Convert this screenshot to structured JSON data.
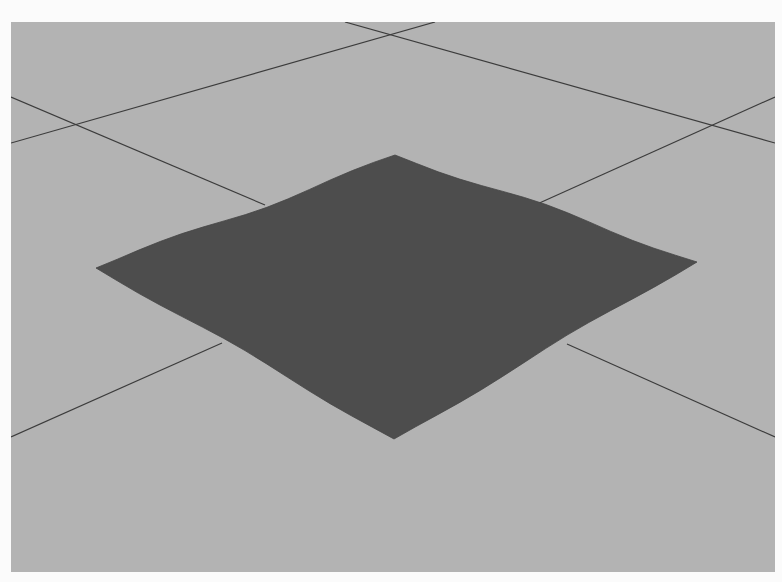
{
  "scene": {
    "description": "3D viewport showing a subdivided plane mesh resting on a ground grid (perspective view)",
    "background_color": "#b3b3b3",
    "frame_color": "#fbfbfb",
    "viewport": {
      "x": 11,
      "y": 22,
      "width": 764,
      "height": 550
    },
    "grid": {
      "line_color": "#3c3c3c",
      "lines": [
        {
          "id": "grid-line-1",
          "x1": 334,
          "y1": 0,
          "x2": 764,
          "y2": 121
        },
        {
          "id": "grid-line-2",
          "x1": 0,
          "y1": 121,
          "x2": 424,
          "y2": 0
        },
        {
          "id": "grid-line-3",
          "x1": 0,
          "y1": 75,
          "x2": 254,
          "y2": 183
        },
        {
          "id": "grid-line-4",
          "x1": 524,
          "y1": 183,
          "x2": 764,
          "y2": 75
        },
        {
          "id": "grid-line-5",
          "x1": 0,
          "y1": 415,
          "x2": 211,
          "y2": 321
        },
        {
          "id": "grid-line-6",
          "x1": 556,
          "y1": 322,
          "x2": 764,
          "y2": 415
        }
      ]
    },
    "plane_mesh": {
      "color": "#4d4d4d",
      "corners": {
        "top": [
          384,
          133
        ],
        "right": [
          686,
          240
        ],
        "bottom": [
          383,
          417
        ],
        "left": [
          85,
          246
        ]
      }
    }
  }
}
